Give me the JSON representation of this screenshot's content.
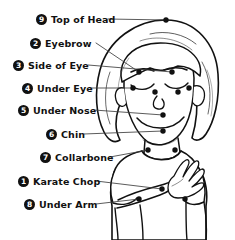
{
  "diagram": {
    "type": "annotated-body-diagram",
    "colors": {
      "background": "#ffffff",
      "ink": "#111111",
      "badge_fill": "#111111",
      "badge_text": "#ffffff",
      "leader_line": "#444444",
      "point_marker": "#111111"
    },
    "points": [
      {
        "number": "9",
        "label": "Top of Head",
        "label_x": 36,
        "label_y": 12,
        "target_x": 166,
        "target_y": 20,
        "leader": "M 108 19 L 166 20"
      },
      {
        "number": "2",
        "label": "Eyebrow",
        "label_x": 30,
        "label_y": 36,
        "target_x": 139,
        "target_y": 72,
        "leader": "M 96 43 L 139 72"
      },
      {
        "number": "3",
        "label": "Side of Eye",
        "label_x": 13,
        "label_y": 58,
        "target_x": 172,
        "target_y": 72,
        "leader": "M 88 65 L 172 72"
      },
      {
        "number": "4",
        "label": "Under Eye",
        "label_x": 22,
        "label_y": 81,
        "target_x": 133,
        "target_y": 88,
        "leader": "M 90 88 L 133 88"
      },
      {
        "number": "5",
        "label": "Under Nose",
        "label_x": 18,
        "label_y": 103,
        "target_x": 163,
        "target_y": 115,
        "leader": "M 94 110 L 163 115"
      },
      {
        "number": "6",
        "label": "Chin",
        "label_x": 46,
        "label_y": 127,
        "target_x": 163,
        "target_y": 131,
        "leader": "M 84 134 L 163 131"
      },
      {
        "number": "7",
        "label": "Collarbone",
        "label_x": 40,
        "label_y": 150,
        "target_x": 148,
        "target_y": 150,
        "leader": "M 110 157 L 148 150"
      },
      {
        "number": "1",
        "label": "Karate Chop",
        "label_x": 18,
        "label_y": 174,
        "target_x": 162,
        "target_y": 189,
        "leader": "M 96 181 L 162 189"
      },
      {
        "number": "8",
        "label": "Under Arm",
        "label_x": 24,
        "label_y": 197,
        "target_x": 139,
        "target_y": 199,
        "leader": "M 96 204 L 139 199"
      }
    ],
    "extra_markers": [
      {
        "name": "under-eye-left-outer",
        "x": 189,
        "y": 88
      },
      {
        "name": "under-eye-inner",
        "x": 155,
        "y": 92
      },
      {
        "name": "under-eye-right-inner",
        "x": 178,
        "y": 92
      },
      {
        "name": "collarbone-right",
        "x": 175,
        "y": 150
      },
      {
        "name": "under-arm-right",
        "x": 185,
        "y": 199
      }
    ]
  }
}
